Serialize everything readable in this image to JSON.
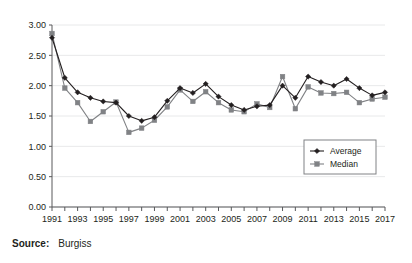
{
  "source": {
    "label": "Source:",
    "value": "Burgiss"
  },
  "chart_data": {
    "type": "line",
    "title": "",
    "xlabel": "",
    "ylabel": "",
    "ylim": [
      0.0,
      3.0
    ],
    "ytick_values": [
      0.0,
      0.5,
      1.0,
      1.5,
      2.0,
      2.5,
      3.0
    ],
    "ytick_labels": [
      "0.00",
      "0.50",
      "1.00",
      "1.50",
      "2.00",
      "2.50",
      "3.00"
    ],
    "grid": true,
    "grid_axis": "y",
    "legend_position": "bottom-right",
    "x": [
      1991,
      1992,
      1993,
      1994,
      1995,
      1996,
      1997,
      1998,
      1999,
      2000,
      2001,
      2002,
      2003,
      2004,
      2005,
      2006,
      2007,
      2008,
      2009,
      2010,
      2011,
      2012,
      2013,
      2014,
      2015,
      2016,
      2017
    ],
    "xtick_labels": [
      "1991",
      "1993",
      "1995",
      "1997",
      "1999",
      "2001",
      "2003",
      "2005",
      "2007",
      "2009",
      "2011",
      "2013",
      "2015",
      "2017"
    ],
    "xtick_values": [
      1991,
      1993,
      1995,
      1997,
      1999,
      2001,
      2003,
      2005,
      2007,
      2009,
      2011,
      2013,
      2015,
      2017
    ],
    "series": [
      {
        "name": "Average",
        "color": "#231f20",
        "marker": "diamond",
        "values": [
          2.79,
          2.13,
          1.89,
          1.8,
          1.74,
          1.72,
          1.5,
          1.42,
          1.48,
          1.75,
          1.96,
          1.88,
          2.03,
          1.82,
          1.68,
          1.6,
          1.66,
          1.68,
          2.0,
          1.8,
          2.15,
          2.06,
          2.0,
          2.11,
          1.96,
          1.84,
          1.89
        ]
      },
      {
        "name": "Median",
        "color": "#808285",
        "marker": "square",
        "values": [
          2.86,
          1.96,
          1.72,
          1.41,
          1.57,
          1.73,
          1.23,
          1.3,
          1.43,
          1.65,
          1.93,
          1.74,
          1.9,
          1.72,
          1.6,
          1.57,
          1.7,
          1.64,
          2.15,
          1.62,
          1.98,
          1.88,
          1.87,
          1.89,
          1.72,
          1.78,
          1.81
        ]
      }
    ]
  }
}
